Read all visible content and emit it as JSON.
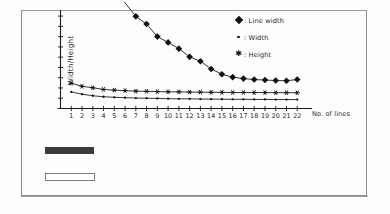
{
  "page": {
    "background_color": "#fdfdfd",
    "frame_color": "#8e8e8e"
  },
  "figure": {
    "plot_background": "#ffffff",
    "axis_color": "#1a1a1a",
    "series_color": "#111111"
  },
  "caption_bar": {
    "text": "",
    "background_color": "#3c3c3c",
    "note": "dark highlighted text bar, text illegible at this resolution"
  },
  "empty_box": {
    "label": "",
    "border_color": "#7d7d7d"
  },
  "chart_data": {
    "type": "line",
    "title": "",
    "subtitle": "",
    "xlabel": "No. of lines",
    "ylabel": "Width/Height",
    "grid": false,
    "legend_position": "top-right",
    "x": [
      1,
      2,
      3,
      4,
      5,
      6,
      7,
      8,
      9,
      10,
      11,
      12,
      13,
      14,
      15,
      16,
      17,
      18,
      19,
      20,
      21,
      22
    ],
    "xtick_labels": [
      "1",
      "2",
      "3",
      "4",
      "5",
      "6",
      "7",
      "8",
      "9",
      "10",
      "11",
      "12",
      "13",
      "14",
      "15",
      "16",
      "17",
      "18",
      "19",
      "20",
      "21",
      "22"
    ],
    "xlim": [
      0,
      23
    ],
    "ylim": [
      0,
      10
    ],
    "ytick_labels": [],
    "ytick_count": 9,
    "series": [
      {
        "name": "Line width",
        "marker": "filled-diamond",
        "legend_label": ": Line width",
        "color": "#111111",
        "values": [
          null,
          null,
          null,
          null,
          null,
          null,
          9.55,
          8.75,
          7.45,
          6.85,
          6.2,
          5.35,
          4.9,
          4.1,
          3.55,
          3.25,
          3.1,
          3.0,
          2.95,
          2.9,
          2.88,
          3.0
        ],
        "note": "values for x=1..6 rise above the top of the plot area and are clipped"
      },
      {
        "name": "Width",
        "marker": "small-dot",
        "legend_label": ": Width",
        "color": "#111111",
        "values": [
          1.72,
          1.48,
          1.32,
          1.22,
          1.16,
          1.12,
          1.08,
          1.06,
          1.04,
          1.02,
          1.0,
          1.0,
          0.98,
          0.97,
          0.96,
          0.95,
          0.95,
          0.94,
          0.94,
          0.93,
          0.93,
          0.92
        ]
      },
      {
        "name": "Height",
        "marker": "asterisk",
        "legend_label": ": Height",
        "color": "#111111",
        "values": [
          2.62,
          2.3,
          2.15,
          1.98,
          1.9,
          1.85,
          1.8,
          1.78,
          1.75,
          1.73,
          1.72,
          1.7,
          1.69,
          1.68,
          1.67,
          1.66,
          1.66,
          1.65,
          1.65,
          1.64,
          1.64,
          1.63
        ]
      }
    ]
  }
}
